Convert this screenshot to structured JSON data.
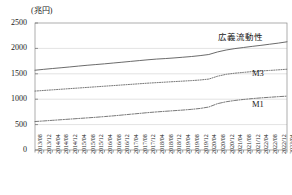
{
  "chart_data": {
    "type": "line",
    "title": "",
    "subtitle": "",
    "unit_label": "(兆円)",
    "xlabel": "",
    "ylabel": "",
    "ylim": [
      0,
      2500
    ],
    "yticks": [
      0,
      500,
      1000,
      1500,
      2000,
      2500
    ],
    "ytick_labels": [
      "0",
      "500",
      "1000",
      "1500",
      "2000",
      "2500"
    ],
    "grid": true,
    "grid_axis": "y",
    "legend_position": "inline-right",
    "x": [
      "2013/08",
      "2013/12",
      "2014/04",
      "2014/08",
      "2014/12",
      "2015/04",
      "2015/08",
      "2015/12",
      "2016/04",
      "2016/08",
      "2016/12",
      "2017/04",
      "2017/08",
      "2017/12",
      "2018/04",
      "2018/08",
      "2018/12",
      "2019/04",
      "2019/08",
      "2019/12",
      "2020/04",
      "2020/08",
      "2020/12",
      "2021/04",
      "2021/08",
      "2021/12",
      "2022/04",
      "2022/08",
      "2022/12",
      "2023/04"
    ],
    "xtick_labels": [
      "2013/08",
      "2013/12",
      "2014/04",
      "2014/08",
      "2014/12",
      "2015/04",
      "2015/08",
      "2015/12",
      "2016/04",
      "2016/08",
      "2016/12",
      "2017/04",
      "2017/08",
      "2017/12",
      "2018/04",
      "2018/08",
      "2018/12",
      "2019/04",
      "2019/08",
      "2019/12",
      "2020/04",
      "2020/08",
      "2020/12",
      "2021/04",
      "2021/08",
      "2021/12",
      "2022/04",
      "2022/08",
      "2022/12",
      "2023/04"
    ],
    "series": [
      {
        "name": "広義流動性",
        "label": "広義流動性",
        "style": "solid",
        "color": "#5a5a5a",
        "values": [
          1570,
          1588,
          1604,
          1619,
          1635,
          1652,
          1668,
          1682,
          1696,
          1712,
          1728,
          1744,
          1760,
          1776,
          1790,
          1800,
          1812,
          1826,
          1840,
          1858,
          1880,
          1930,
          1968,
          1996,
          2018,
          2040,
          2060,
          2082,
          2104,
          2130
        ]
      },
      {
        "name": "M3",
        "label": "M3",
        "style": "dotted",
        "color": "#6a6a6a",
        "values": [
          1160,
          1172,
          1184,
          1196,
          1208,
          1220,
          1232,
          1244,
          1256,
          1268,
          1280,
          1292,
          1304,
          1316,
          1326,
          1336,
          1346,
          1356,
          1366,
          1378,
          1396,
          1452,
          1490,
          1512,
          1528,
          1544,
          1556,
          1566,
          1578,
          1590
        ]
      },
      {
        "name": "M1",
        "label": "M1",
        "style": "dashdot",
        "color": "#6a6a6a",
        "values": [
          560,
          572,
          584,
          596,
          608,
          620,
          632,
          644,
          658,
          672,
          688,
          704,
          720,
          736,
          750,
          762,
          774,
          786,
          800,
          818,
          846,
          912,
          950,
          975,
          995,
          1012,
          1026,
          1038,
          1050,
          1060
        ]
      }
    ],
    "series_label_positions": [
      {
        "label": "広義流動性",
        "x": 218,
        "y": 30
      },
      {
        "label": "M3",
        "x": 252,
        "y": 68
      },
      {
        "label": "M1",
        "x": 252,
        "y": 99
      }
    ]
  }
}
